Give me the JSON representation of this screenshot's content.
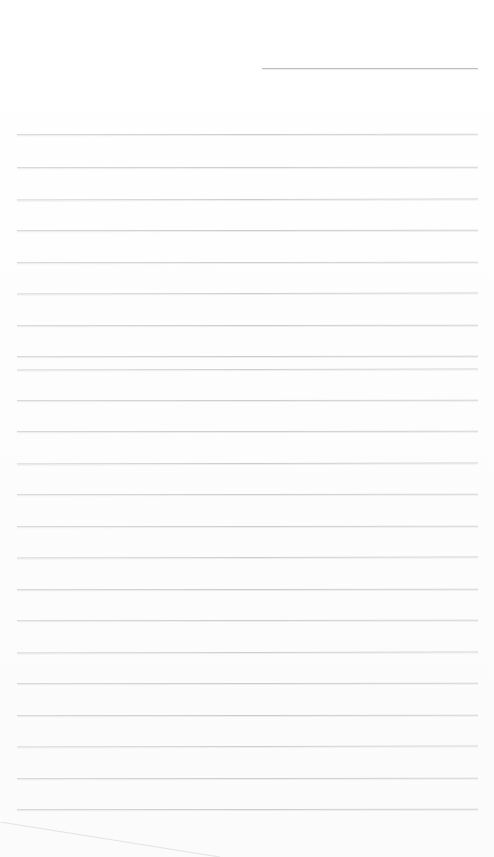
{
  "document": {
    "kind": "blank-lined-paper-scan",
    "page_width": 494,
    "page_height": 857,
    "background_color": "#fefefe",
    "rule_color": "#c9cbcd",
    "header_rule_color": "#b9bcbf",
    "edge_color": "#dfe1e2",
    "visible_text": "",
    "header_rule": {
      "name": "header-rule",
      "x": 262,
      "y": 68,
      "width": 216
    },
    "rule_lines": [
      {
        "y": 134,
        "x": 17,
        "width": 461
      },
      {
        "y": 167,
        "x": 17,
        "width": 461
      },
      {
        "y": 199,
        "x": 17,
        "width": 461
      },
      {
        "y": 230,
        "x": 17,
        "width": 461
      },
      {
        "y": 262,
        "x": 17,
        "width": 461
      },
      {
        "y": 293,
        "x": 17,
        "width": 461
      },
      {
        "y": 325,
        "x": 17,
        "width": 461
      },
      {
        "y": 356,
        "x": 17,
        "width": 461
      },
      {
        "y": 369,
        "x": 17,
        "width": 461
      },
      {
        "y": 400,
        "x": 17,
        "width": 461
      },
      {
        "y": 431,
        "x": 17,
        "width": 461
      },
      {
        "y": 463,
        "x": 17,
        "width": 461
      },
      {
        "y": 494,
        "x": 17,
        "width": 461
      },
      {
        "y": 526,
        "x": 17,
        "width": 461
      },
      {
        "y": 557,
        "x": 17,
        "width": 461
      },
      {
        "y": 589,
        "x": 17,
        "width": 461
      },
      {
        "y": 620,
        "x": 17,
        "width": 461
      },
      {
        "y": 652,
        "x": 17,
        "width": 461
      },
      {
        "y": 683,
        "x": 17,
        "width": 461
      },
      {
        "y": 715,
        "x": 17,
        "width": 461
      },
      {
        "y": 746,
        "x": 17,
        "width": 461
      },
      {
        "y": 778,
        "x": 17,
        "width": 461
      },
      {
        "y": 809,
        "x": 17,
        "width": 461
      }
    ],
    "page_edge": {
      "name": "page-edge-diagonal",
      "x1": 0,
      "y1": 822,
      "x2": 220,
      "y2": 857,
      "color": "#e3e5e6"
    }
  }
}
